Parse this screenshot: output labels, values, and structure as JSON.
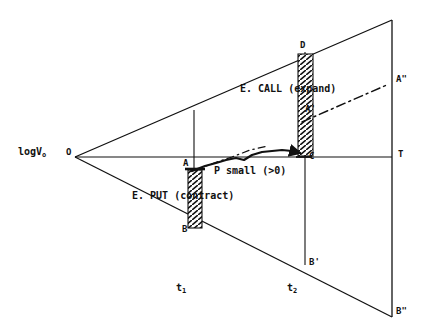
{
  "figure": {
    "type": "cone-of-uncertainty-option-diagram",
    "axis_label_y": "logV",
    "axis_label_y_sub": "o",
    "origin_label": "O",
    "terminal_label": "T"
  },
  "points": {
    "O": {
      "label": "O",
      "x": 75,
      "y": 157
    },
    "A": {
      "label": "A",
      "x": 194,
      "y": 168
    },
    "B": {
      "label": "B",
      "x": 194,
      "y": 228
    },
    "C": {
      "label": "C",
      "x": 305,
      "y": 155
    },
    "D": {
      "label": "D",
      "x": 305,
      "y": 52
    },
    "Ap": {
      "label": "A'",
      "x": 305,
      "y": 112
    },
    "App": {
      "label": "A\"",
      "x": 390,
      "y": 82
    },
    "Bp": {
      "label": "B'",
      "x": 305,
      "y": 265
    },
    "Bpp": {
      "label": "B\"",
      "x": 392,
      "y": 317
    },
    "T": {
      "label": "T",
      "x": 392,
      "y": 157
    }
  },
  "annotations": {
    "call": "E. CALL (expand)",
    "put": "E. PUT (contract)",
    "path": "P small (>0)"
  },
  "axis_ticks": [
    {
      "label": "t",
      "sub": "1",
      "x": 194
    },
    {
      "label": "t",
      "sub": "2",
      "x": 305
    }
  ],
  "colors": {
    "line": "#111111",
    "background": "#ffffff",
    "hatch": "#111111"
  }
}
